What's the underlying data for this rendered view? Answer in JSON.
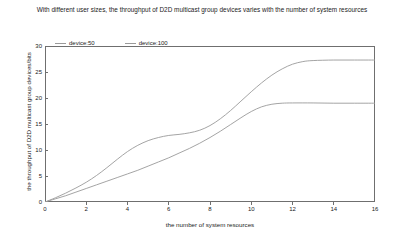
{
  "chart_data": {
    "type": "line",
    "title": "With different user sizes, the throughput of D2D multicast group devices varies with the number of system resources",
    "xlabel": "the number of system resources",
    "ylabel": "the throughput of D2D multicast group devices/bits",
    "xlim": [
      0,
      16
    ],
    "ylim": [
      0,
      30
    ],
    "xticks": [
      0,
      2,
      4,
      6,
      8,
      10,
      12,
      14,
      16
    ],
    "yticks": [
      0,
      5,
      10,
      15,
      20,
      25,
      30
    ],
    "grid": false,
    "legend_position": "top-left-inside",
    "series": [
      {
        "name": "device:50",
        "color": "#9a9a9a",
        "x": [
          0,
          0.5,
          1,
          1.5,
          2,
          2.5,
          3,
          3.5,
          4,
          4.5,
          5,
          5.5,
          6,
          6.5,
          7,
          7.5,
          8,
          8.5,
          9,
          9.5,
          10,
          10.5,
          11,
          11.5,
          12,
          13,
          14,
          15,
          16
        ],
        "y": [
          0,
          0.6,
          1.2,
          1.9,
          2.6,
          3.3,
          4.0,
          4.7,
          5.4,
          6.1,
          6.9,
          7.7,
          8.5,
          9.4,
          10.3,
          11.3,
          12.4,
          13.6,
          14.9,
          16.2,
          17.4,
          18.3,
          18.8,
          19.0,
          19.05,
          19.05,
          19.0,
          19.0,
          19.0
        ]
      },
      {
        "name": "device:100",
        "color": "#9a9a9a",
        "x": [
          0,
          0.5,
          1,
          1.5,
          2,
          2.5,
          3,
          3.5,
          4,
          4.5,
          5,
          5.5,
          6,
          6.5,
          7,
          7.5,
          8,
          8.5,
          9,
          9.5,
          10,
          10.5,
          11,
          11.5,
          12,
          12.5,
          13,
          14,
          15,
          16
        ],
        "y": [
          0,
          0.8,
          1.7,
          2.7,
          3.8,
          5.1,
          6.6,
          8.2,
          9.7,
          10.9,
          11.8,
          12.4,
          12.8,
          13.0,
          13.3,
          13.8,
          14.7,
          16.0,
          17.6,
          19.4,
          21.2,
          22.9,
          24.4,
          25.6,
          26.5,
          27.0,
          27.2,
          27.3,
          27.3,
          27.3
        ]
      }
    ]
  }
}
